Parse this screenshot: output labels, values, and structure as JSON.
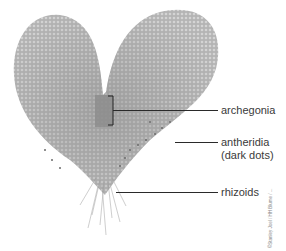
{
  "figure": {
    "background": "#ffffff",
    "tissue_color": "#9a9a9a",
    "labels": [
      {
        "id": "archegonia",
        "text": "archegonia"
      },
      {
        "id": "antheridia",
        "text": "antheridia",
        "text2": "(dark dots)"
      },
      {
        "id": "rhizoids",
        "text": "rhizoids"
      }
    ],
    "credit": "©Stanley Joel / HH Blume / ..."
  }
}
